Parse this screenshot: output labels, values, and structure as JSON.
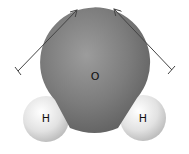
{
  "diagram": {
    "type": "molecule",
    "atoms": [
      {
        "id": "O",
        "label": "O",
        "cx": 95,
        "cy": 74,
        "r": 55
      },
      {
        "id": "H1",
        "label": "H",
        "cx": 46,
        "cy": 119,
        "r": 23
      },
      {
        "id": "H2",
        "label": "H",
        "cx": 143,
        "cy": 118,
        "r": 23
      }
    ],
    "dipole_arrows": [
      {
        "id": "left",
        "x1": 18,
        "y1": 71,
        "x2": 77,
        "y2": 10
      },
      {
        "id": "right",
        "x1": 172,
        "y1": 70,
        "x2": 114,
        "y2": 9
      }
    ],
    "colors": {
      "oxygen": "#7a7a7a",
      "oxygen_light": "#9a9a9a",
      "oxygen_dark": "#5e5e5e",
      "hydrogen": "#e6e6e6",
      "hydrogen_light": "#ffffff",
      "hydrogen_dark": "#bcbcbc",
      "arrow": "#444444"
    }
  }
}
